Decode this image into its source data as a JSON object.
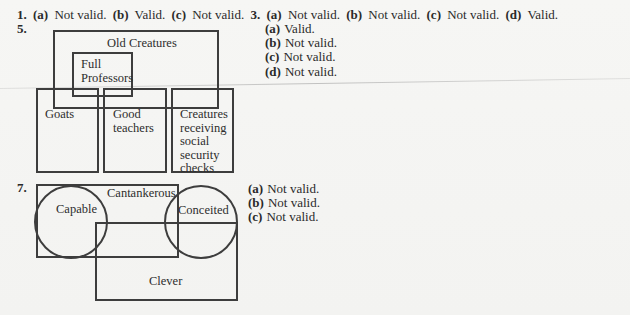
{
  "header_line": {
    "problem1": {
      "number": "1.",
      "parts": [
        {
          "label": "(a)",
          "answer": "Not valid."
        },
        {
          "label": "(b)",
          "answer": "Valid."
        },
        {
          "label": "(c)",
          "answer": "Not valid."
        }
      ]
    },
    "problem3": {
      "number": "3.",
      "parts": [
        {
          "label": "(a)",
          "answer": "Not valid."
        },
        {
          "label": "(b)",
          "answer": "Not valid."
        },
        {
          "label": "(c)",
          "answer": "Not valid."
        },
        {
          "label": "(d)",
          "answer": "Valid."
        }
      ]
    }
  },
  "problem5": {
    "number": "5.",
    "diagram": {
      "type": "euler-boxes",
      "regions": {
        "old_creatures": "Old Creatures",
        "full_professors": [
          "Full",
          "Professors"
        ],
        "goats": "Goats",
        "good_teachers": [
          "Good",
          "teachers"
        ],
        "creatures_receiving": [
          "Creatures",
          "receiving",
          "social",
          "security",
          "checks"
        ]
      }
    },
    "answers": [
      {
        "label": "(a)",
        "answer": "Valid."
      },
      {
        "label": "(b)",
        "answer": "Not valid."
      },
      {
        "label": "(c)",
        "answer": "Not valid."
      },
      {
        "label": "(d)",
        "answer": "Not valid."
      }
    ]
  },
  "problem7": {
    "number": "7.",
    "diagram": {
      "type": "euler-mixed",
      "regions": {
        "cantankerous": "Cantankerous",
        "capable": "Capable",
        "conceited": "Conceited",
        "clever": "Clever"
      }
    },
    "answers": [
      {
        "label": "(a)",
        "answer": "Not valid."
      },
      {
        "label": "(b)",
        "answer": "Not valid."
      },
      {
        "label": "(c)",
        "answer": "Not valid."
      }
    ]
  },
  "colors": {
    "paper": "#f4f4f2",
    "ink": "#2a2a2a",
    "stroke": "#3d3d3d"
  }
}
